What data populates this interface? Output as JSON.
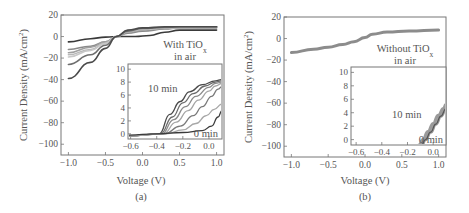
{
  "chart_data": [
    {
      "panel": "(a)",
      "type": "line",
      "title": "",
      "xlabel": "Voltage (V)",
      "ylabel": "Current Density (mA/cm²)",
      "xlim": [
        -1.1,
        1.1
      ],
      "ylim": [
        -110,
        20
      ],
      "xticks": [
        "-1.0",
        "-0.5",
        "0.0",
        "0.5",
        "1.0"
      ],
      "xtick_values": [
        -1.0,
        -0.5,
        0.0,
        0.5,
        1.0
      ],
      "yticks": [
        "20",
        "0",
        "-20",
        "-40",
        "-60",
        "-80",
        "-100"
      ],
      "ytick_values": [
        20,
        0,
        -20,
        -40,
        -60,
        -80,
        -100
      ],
      "annotation": [
        "With TiOx",
        "in air"
      ],
      "grid": false,
      "series": [
        {
          "name": "0 min",
          "color": "#3a3a3a",
          "x": [
            -1.0,
            -0.7,
            -0.5,
            -0.3,
            -0.1,
            0.1,
            0.3,
            0.5,
            1.0
          ],
          "y": [
            -5,
            -2,
            -0.5,
            0,
            0,
            1,
            4,
            6,
            6
          ]
        },
        {
          "name": "1",
          "color": "#8a8a8a",
          "x": [
            -1.0,
            -0.7,
            -0.5,
            -0.35,
            -0.2,
            0,
            0.3,
            0.5,
            1.0
          ],
          "y": [
            -12,
            -9,
            -5,
            0,
            3,
            5,
            7,
            8,
            8
          ]
        },
        {
          "name": "2",
          "color": "#a0a0a0",
          "x": [
            -1.0,
            -0.7,
            -0.5,
            -0.35,
            -0.2,
            0,
            0.3,
            0.5,
            1.0
          ],
          "y": [
            -15,
            -10,
            -5,
            0,
            4,
            6,
            7.5,
            8,
            8.5
          ]
        },
        {
          "name": "3",
          "color": "#b8b8b8",
          "x": [
            -1.0,
            -0.7,
            -0.5,
            -0.35,
            -0.2,
            0,
            0.3,
            0.5,
            1.0
          ],
          "y": [
            -17,
            -12,
            -6,
            0,
            4.5,
            6.5,
            8,
            8.5,
            8.5
          ]
        },
        {
          "name": "4",
          "color": "#c8c8c8",
          "x": [
            -1.0,
            -0.7,
            -0.5,
            -0.35,
            -0.2,
            0,
            0.3,
            0.5,
            1.0
          ],
          "y": [
            -19,
            -13,
            -6.5,
            0,
            5,
            7,
            8,
            8.5,
            9
          ]
        },
        {
          "name": "5",
          "color": "#6e6e6e",
          "x": [
            -1.0,
            -0.7,
            -0.5,
            -0.35,
            -0.2,
            0,
            0.3,
            0.5,
            1.0
          ],
          "y": [
            -26,
            -17,
            -8,
            0,
            5,
            7.5,
            8.5,
            9,
            9
          ]
        },
        {
          "name": "10 min",
          "color": "#4a4a4a",
          "x": [
            -1.0,
            -0.7,
            -0.5,
            -0.35,
            -0.2,
            0,
            0.3,
            0.5,
            1.0
          ],
          "y": [
            -39,
            -24,
            -11,
            0,
            6,
            8,
            9,
            9,
            9
          ]
        }
      ],
      "inset": {
        "xlim": [
          -0.62,
          0.1
        ],
        "ylim": [
          -0.8,
          10.8
        ],
        "xticks": [
          "-0.6",
          "-0.4",
          "-0.2",
          "0.0"
        ],
        "xtick_values": [
          -0.6,
          -0.4,
          -0.2,
          0.0
        ],
        "yticks": [
          "10",
          "8",
          "6",
          "4",
          "2",
          "0"
        ],
        "ytick_values": [
          10,
          8,
          6,
          4,
          2,
          0
        ],
        "labels": [
          "10 min",
          "0 min"
        ],
        "series": [
          {
            "name": "10 min",
            "x": [
              -0.62,
              -0.38,
              -0.3,
              -0.22,
              -0.15,
              -0.05,
              0.05,
              0.1
            ],
            "y": [
              -0.3,
              0,
              3,
              5,
              6.5,
              7.6,
              8.2,
              8.4
            ]
          },
          {
            "name": "9",
            "x": [
              -0.62,
              -0.37,
              -0.28,
              -0.2,
              -0.12,
              -0.03,
              0.05,
              0.1
            ],
            "y": [
              -0.3,
              0,
              2.6,
              4.8,
              6.2,
              7.4,
              8,
              8.2
            ]
          },
          {
            "name": "8",
            "x": [
              -0.62,
              -0.36,
              -0.27,
              -0.18,
              -0.1,
              0,
              0.05,
              0.1
            ],
            "y": [
              -0.3,
              0,
              2.2,
              4.2,
              5.8,
              7.2,
              7.8,
              8
            ]
          },
          {
            "name": "7",
            "x": [
              -0.62,
              -0.35,
              -0.25,
              -0.16,
              -0.08,
              0,
              0.05,
              0.1
            ],
            "y": [
              -0.3,
              0,
              1.8,
              3.6,
              5.2,
              6.6,
              7.4,
              7.8
            ]
          },
          {
            "name": "6",
            "x": [
              -0.62,
              -0.34,
              -0.22,
              -0.12,
              -0.05,
              0.02,
              0.07,
              0.1
            ],
            "y": [
              -0.3,
              0,
              1.2,
              2.8,
              4.2,
              5.8,
              6.9,
              7.3
            ]
          },
          {
            "name": "5",
            "x": [
              -0.62,
              -0.33,
              -0.2,
              -0.1,
              -0.02,
              0.04,
              0.1
            ],
            "y": [
              -0.3,
              0,
              0.6,
              1.6,
              2.8,
              3.8,
              4.6
            ]
          },
          {
            "name": "0 min",
            "x": [
              -0.62,
              -0.4,
              -0.2,
              -0.05,
              0.02,
              0.07,
              0.1
            ],
            "y": [
              -0.2,
              0,
              0.2,
              0.5,
              1.2,
              2.6,
              3.6
            ]
          }
        ]
      }
    },
    {
      "panel": "(b)",
      "type": "line",
      "title": "",
      "xlabel": "Voltage (V)",
      "ylabel": "Current Density (mA/cm²)",
      "xlim": [
        -1.1,
        1.1
      ],
      "ylim": [
        -110,
        20
      ],
      "xticks": [
        "-1.0",
        "-0.5",
        "0.0",
        "0.5",
        "1.0"
      ],
      "xtick_values": [
        -1.0,
        -0.5,
        0.0,
        0.5,
        1.0
      ],
      "yticks": [
        "20",
        "0",
        "-20",
        "-40",
        "-60",
        "-80",
        "-100"
      ],
      "ytick_values": [
        20,
        0,
        -20,
        -40,
        -60,
        -80,
        -100
      ],
      "annotation": [
        "Without TiOx",
        "in air"
      ],
      "grid": false,
      "series": [
        {
          "name": "0-10 min (overlapping)",
          "color": "#808080",
          "x": [
            -1.0,
            -0.7,
            -0.5,
            -0.3,
            -0.15,
            0,
            0.1,
            0.3,
            0.6,
            1.0
          ],
          "y": [
            -13,
            -10,
            -8,
            -5.5,
            -3,
            1,
            4,
            6,
            7,
            8
          ]
        }
      ],
      "inset": {
        "xlim": [
          -0.64,
          0.1
        ],
        "ylim": [
          -0.8,
          10.8
        ],
        "xticks": [
          "-0.6",
          "-0.4",
          "-0.2",
          "0.0"
        ],
        "xtick_values": [
          -0.6,
          -0.4,
          -0.2,
          0.0
        ],
        "yticks": [
          "10",
          "8",
          "6",
          "4",
          "2",
          "0"
        ],
        "ytick_values": [
          10,
          8,
          6,
          4,
          2,
          0
        ],
        "labels": [
          "10 min",
          "0 min"
        ],
        "series": [
          {
            "name": "10 min",
            "x": [
              -0.11,
              -0.08,
              -0.04,
              0,
              0.04,
              0.08,
              0.1
            ],
            "y": [
              -0.8,
              0,
              1.2,
              2.4,
              3.6,
              4.6,
              5.2
            ]
          },
          {
            "name": "0 min",
            "x": [
              -0.09,
              -0.06,
              -0.02,
              0.02,
              0.06,
              0.1
            ],
            "y": [
              -0.8,
              0,
              1.1,
              2.3,
              3.5,
              4.6
            ]
          }
        ]
      }
    }
  ],
  "panels": {
    "a": {
      "ylabel": "Current Density (mA/cm",
      "ylabel_sup": "2",
      "ylabel_end": ")",
      "xlabel": "Voltage (V)",
      "caption": "(a)",
      "annotation_line1": "With TiO",
      "annotation_sub": "x",
      "annotation_line2": "in air",
      "inset_label_top": "10 min",
      "inset_label_bottom": "0 min"
    },
    "b": {
      "ylabel": "Current Density (mA/cm",
      "ylabel_sup": "2",
      "ylabel_end": ")",
      "xlabel": "Voltage (V)",
      "caption": "(b)",
      "annotation_line1": "Without TiO",
      "annotation_sub": "x",
      "annotation_line2": "in air",
      "inset_label_top": "10 min",
      "inset_label_bottom": "0 min"
    }
  }
}
